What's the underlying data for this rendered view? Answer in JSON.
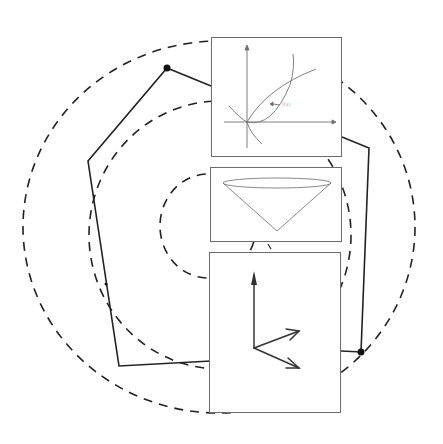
{
  "figure": {
    "colors": {
      "stroke": "#222222",
      "panel_border": "#6b6b6b",
      "panel_line": "#707070",
      "background": "#ffffff"
    }
  },
  "ellipses": [
    {
      "name": "outer",
      "cx": 219,
      "cy": 227,
      "rx": 196,
      "ry": 186
    },
    {
      "name": "middle",
      "cx": 220,
      "cy": 235,
      "rx": 131,
      "ry": 134
    },
    {
      "name": "inner",
      "cx": 208,
      "cy": 226,
      "rx": 48,
      "ry": 52
    }
  ],
  "polygon": {
    "points": [
      [
        167,
        68
      ],
      [
        88,
        161
      ],
      [
        106,
        313
      ],
      [
        119,
        366
      ],
      [
        211,
        360
      ]
    ],
    "right_points": [
      [
        342,
        137
      ],
      [
        369,
        148
      ],
      [
        361,
        352
      ],
      [
        341,
        351
      ]
    ],
    "markers": [
      [
        167,
        68
      ],
      [
        361,
        352
      ]
    ]
  },
  "panels": [
    {
      "name": "curves-panel",
      "x": 211,
      "y": 37,
      "w": 131,
      "h": 120,
      "annotation": "f(x)"
    },
    {
      "name": "cone-panel",
      "x": 210,
      "y": 167,
      "w": 132,
      "h": 75
    },
    {
      "name": "vectors-panel",
      "x": 209,
      "y": 252,
      "w": 132,
      "h": 161
    }
  ]
}
